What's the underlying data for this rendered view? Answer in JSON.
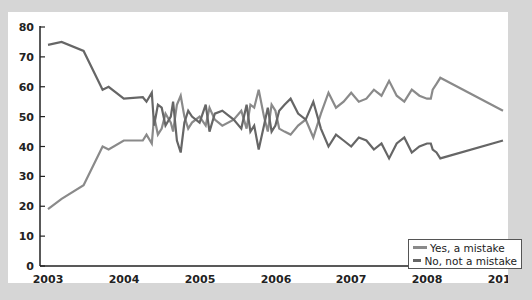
{
  "chart_data": {
    "type": "line",
    "title": "",
    "xlabel": "",
    "ylabel": "",
    "ylim": [
      0,
      80
    ],
    "yticks": [
      0,
      10,
      20,
      30,
      40,
      50,
      60,
      70,
      80
    ],
    "xtick_labels": [
      "2003",
      "2004",
      "2005",
      "2006",
      "2007",
      "2008",
      "2010"
    ],
    "grid": false,
    "legend_position": "lower right",
    "series": [
      {
        "name": "Yes, a mistake",
        "color": "#8a8a8a",
        "points": [
          [
            2003.0,
            19
          ],
          [
            2003.18,
            22.5
          ],
          [
            2003.47,
            27
          ],
          [
            2003.72,
            40
          ],
          [
            2003.8,
            39
          ],
          [
            2004.0,
            42
          ],
          [
            2004.25,
            42
          ],
          [
            2004.3,
            44
          ],
          [
            2004.37,
            41
          ],
          [
            2004.4,
            50
          ],
          [
            2004.45,
            44
          ],
          [
            2004.5,
            46
          ],
          [
            2004.55,
            51
          ],
          [
            2004.62,
            48
          ],
          [
            2004.65,
            45
          ],
          [
            2004.7,
            54
          ],
          [
            2004.75,
            57
          ],
          [
            2004.8,
            50
          ],
          [
            2004.85,
            46
          ],
          [
            2004.9,
            48
          ],
          [
            2005.0,
            50
          ],
          [
            2005.08,
            47
          ],
          [
            2005.13,
            53
          ],
          [
            2005.2,
            49
          ],
          [
            2005.3,
            47
          ],
          [
            2005.45,
            49
          ],
          [
            2005.55,
            52
          ],
          [
            2005.62,
            46
          ],
          [
            2005.67,
            54
          ],
          [
            2005.72,
            53
          ],
          [
            2005.78,
            59
          ],
          [
            2005.85,
            50
          ],
          [
            2005.9,
            45
          ],
          [
            2005.95,
            54
          ],
          [
            2006.0,
            52
          ],
          [
            2006.05,
            46
          ],
          [
            2006.12,
            45
          ],
          [
            2006.2,
            44
          ],
          [
            2006.3,
            47
          ],
          [
            2006.4,
            49
          ],
          [
            2006.5,
            43
          ],
          [
            2006.6,
            51
          ],
          [
            2006.7,
            58
          ],
          [
            2006.8,
            53
          ],
          [
            2006.9,
            55
          ],
          [
            2007.0,
            58
          ],
          [
            2007.1,
            55
          ],
          [
            2007.2,
            56
          ],
          [
            2007.3,
            59
          ],
          [
            2007.4,
            57
          ],
          [
            2007.5,
            62
          ],
          [
            2007.6,
            57
          ],
          [
            2007.7,
            55
          ],
          [
            2007.8,
            59
          ],
          [
            2007.9,
            57
          ],
          [
            2008.0,
            56
          ],
          [
            2008.1,
            56
          ],
          [
            2008.15,
            59
          ],
          [
            2008.25,
            61
          ],
          [
            2008.35,
            63
          ],
          [
            2010.0,
            52
          ]
        ]
      },
      {
        "name": "No, not a mistake",
        "color": "#666666",
        "points": [
          [
            2003.0,
            74
          ],
          [
            2003.18,
            75
          ],
          [
            2003.47,
            72
          ],
          [
            2003.72,
            59
          ],
          [
            2003.8,
            60
          ],
          [
            2004.0,
            56
          ],
          [
            2004.25,
            56.5
          ],
          [
            2004.3,
            55
          ],
          [
            2004.37,
            58
          ],
          [
            2004.4,
            47
          ],
          [
            2004.45,
            54
          ],
          [
            2004.5,
            53
          ],
          [
            2004.55,
            47
          ],
          [
            2004.62,
            50
          ],
          [
            2004.65,
            55
          ],
          [
            2004.7,
            42
          ],
          [
            2004.75,
            38
          ],
          [
            2004.8,
            48
          ],
          [
            2004.85,
            52
          ],
          [
            2004.9,
            50
          ],
          [
            2005.0,
            48
          ],
          [
            2005.08,
            54
          ],
          [
            2005.13,
            45
          ],
          [
            2005.2,
            51
          ],
          [
            2005.3,
            52
          ],
          [
            2005.45,
            49
          ],
          [
            2005.55,
            46
          ],
          [
            2005.62,
            54
          ],
          [
            2005.67,
            45
          ],
          [
            2005.72,
            47
          ],
          [
            2005.78,
            39
          ],
          [
            2005.85,
            47
          ],
          [
            2005.9,
            53
          ],
          [
            2005.95,
            45
          ],
          [
            2006.0,
            47
          ],
          [
            2006.05,
            52
          ],
          [
            2006.12,
            54
          ],
          [
            2006.2,
            56
          ],
          [
            2006.3,
            51
          ],
          [
            2006.4,
            49
          ],
          [
            2006.5,
            55
          ],
          [
            2006.6,
            46
          ],
          [
            2006.7,
            40
          ],
          [
            2006.8,
            44
          ],
          [
            2006.9,
            42
          ],
          [
            2007.0,
            40
          ],
          [
            2007.1,
            43
          ],
          [
            2007.2,
            42
          ],
          [
            2007.3,
            39
          ],
          [
            2007.4,
            41
          ],
          [
            2007.5,
            36
          ],
          [
            2007.6,
            41
          ],
          [
            2007.7,
            43
          ],
          [
            2007.8,
            38
          ],
          [
            2007.9,
            40
          ],
          [
            2008.0,
            41
          ],
          [
            2008.1,
            41
          ],
          [
            2008.15,
            39
          ],
          [
            2008.25,
            38
          ],
          [
            2008.35,
            36
          ],
          [
            2010.0,
            42
          ]
        ]
      }
    ]
  },
  "legend": {
    "items": [
      {
        "label": "Yes, a mistake",
        "color": "#8a8a8a"
      },
      {
        "label": "No, not a mistake",
        "color": "#666666"
      }
    ]
  }
}
